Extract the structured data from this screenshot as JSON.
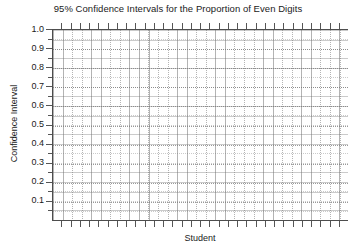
{
  "chart_data": {
    "type": "line",
    "title": "95% Confidence Intervals for the Proportion of Even Digits",
    "xlabel": "Student",
    "ylabel": "Confidence Interval",
    "ylim": [
      0.0,
      1.0
    ],
    "ytick_labels": [
      "1.0",
      "0.9",
      "0.8",
      "0.7",
      "0.6",
      "0.5",
      "0.4",
      "0.3",
      "0.2",
      "0.1"
    ],
    "ytick_values": [
      1.0,
      0.9,
      0.8,
      0.7,
      0.6,
      0.5,
      0.4,
      0.3,
      0.2,
      0.1
    ],
    "xtick_labels": [],
    "x_tick_count": 31,
    "grid": true,
    "grid_style": "dotted",
    "legend": null,
    "series": [],
    "values": [],
    "categories": [],
    "note": "Empty plot region: no confidence interval bars or data points are drawn inside the axes."
  },
  "colors": {
    "background": "#ffffff",
    "axis": "#4d4d4d",
    "tick": "#555555",
    "grid": "#6e6e6e",
    "text": "#1a1a1a"
  }
}
